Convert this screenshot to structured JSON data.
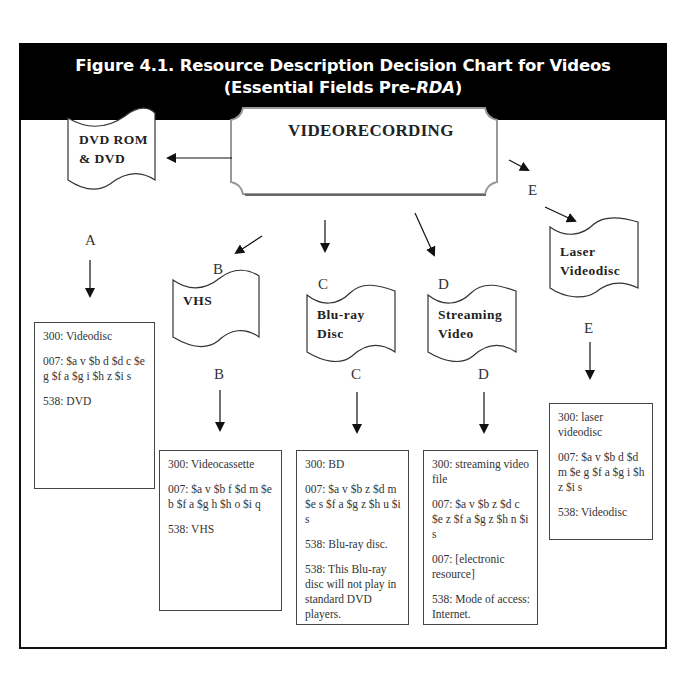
{
  "figure": {
    "title_line1": "Figure 4.1.  Resource Description Decision Chart for Videos",
    "title_line2_prefix": "(Essential Fields Pre-",
    "title_line2_italic": "RDA",
    "title_line2_suffix": ")",
    "colors": {
      "title_bar_bg": "#000000",
      "title_bar_text": "#ffffff",
      "frame": "#111111",
      "line": "#222222"
    }
  },
  "root": {
    "label": "VIDEORECORDING"
  },
  "branches": [
    {
      "id": "A",
      "format_label_line1": "DVD ROM",
      "format_label_line2": "& DVD",
      "letter_top": "",
      "letter_bottom": "A",
      "record": {
        "field_300": "300: Videodisc",
        "field_007": "007: $a v  $b d  $d c $e g  $f a  $g i  $h z $i s",
        "field_538": "538:  DVD"
      }
    },
    {
      "id": "B",
      "format_label_line1": "VHS",
      "format_label_line2": "",
      "letter_top": "B",
      "letter_bottom": "B",
      "record": {
        "field_300": "300: Videocassette",
        "field_007": "007: $a v  $b f  $d m $e b $f a $g h $h o $i q",
        "field_538": "538: VHS"
      }
    },
    {
      "id": "C",
      "format_label_line1": "Blu-ray",
      "format_label_line2": "Disc",
      "letter_top": "C",
      "letter_bottom": "C",
      "record": {
        "field_300": "300:  BD",
        "field_007": "007: $a v  $b z  $d m $e s  $f a  $g z  $h u $i s",
        "field_538a": "538: Blu-ray disc.",
        "field_538b": "538: This Blu-ray disc will not play in standard DVD players."
      }
    },
    {
      "id": "D",
      "format_label_line1": "Streaming",
      "format_label_line2": "Video",
      "letter_top": "D",
      "letter_bottom": "D",
      "record": {
        "field_300": "300:  streaming video file",
        "field_007a": "007: $a v  $b z  $d c $e z  $f a  $g z  $h n $i s",
        "field_007b": "007: [electronic resource]",
        "field_538": "538: Mode of access: Internet."
      }
    },
    {
      "id": "E",
      "format_label_line1": "Laser",
      "format_label_line2": "Videodisc",
      "letter_top": "E",
      "letter_bottom": "E",
      "record": {
        "field_300": "300: laser videodisc",
        "field_007": "007: $a v  $b d  $d m $e g  $f a  $g i  $h z $i s",
        "field_538": "538: Videodisc"
      }
    }
  ]
}
